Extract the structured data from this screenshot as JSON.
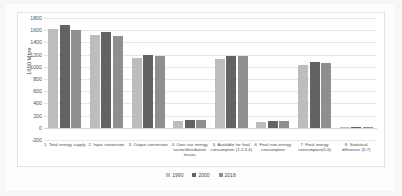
{
  "chart_data": {
    "type": "bar",
    "title": "",
    "xlabel": "",
    "ylabel": "1000 Mtoe",
    "ylim": [
      -200,
      1800
    ],
    "ytick_step": 200,
    "yticks": [
      1800,
      1600,
      1400,
      1200,
      1000,
      800,
      600,
      400,
      200,
      0,
      -200
    ],
    "ytick_labels": [
      "1800",
      "1600",
      "1400",
      "1200",
      "1000",
      "800",
      "600",
      "400",
      "200",
      "0",
      "-200"
    ],
    "grid": true,
    "legend_position": "bottom",
    "categories": [
      "1. Total energy supply",
      "2. Input conversion",
      "3. Output conversion",
      "4. Own use energy sector/distribution losses",
      "5. Available for final consumption (1-2-3-4)",
      "6. Final non-energy consumption",
      "7. Final energy consumption(5-6)",
      "8. Statistical difference (5-7)"
    ],
    "series": [
      {
        "name": "1990",
        "color": "#bdbdbd",
        "values": [
          1620,
          1520,
          1150,
          110,
          1130,
          100,
          1030,
          10
        ]
      },
      {
        "name": "2000",
        "color": "#636363",
        "values": [
          1690,
          1575,
          1190,
          125,
          1180,
          120,
          1080,
          12
        ]
      },
      {
        "name": "2018",
        "color": "#8f8f8f",
        "values": [
          1600,
          1500,
          1185,
          125,
          1175,
          120,
          1070,
          10
        ]
      }
    ]
  },
  "axis": {
    "y_title": "1000 Mtoe"
  },
  "legend": {
    "entries": [
      {
        "label": "1990"
      },
      {
        "label": "2000"
      },
      {
        "label": "2018"
      }
    ]
  }
}
